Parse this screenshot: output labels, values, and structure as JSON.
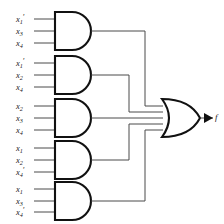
{
  "diagram": {
    "type": "logic-circuit",
    "output_label": "f",
    "and_gates": [
      {
        "id": "and-gate-1",
        "inputs": [
          {
            "var": "x",
            "sub": "1",
            "primed": true
          },
          {
            "var": "x",
            "sub": "3",
            "primed": false
          },
          {
            "var": "x",
            "sub": "4",
            "primed": false
          }
        ]
      },
      {
        "id": "and-gate-2",
        "inputs": [
          {
            "var": "x",
            "sub": "1",
            "primed": true
          },
          {
            "var": "x",
            "sub": "2",
            "primed": false
          },
          {
            "var": "x",
            "sub": "4",
            "primed": false
          }
        ]
      },
      {
        "id": "and-gate-3",
        "inputs": [
          {
            "var": "x",
            "sub": "2",
            "primed": false
          },
          {
            "var": "x",
            "sub": "3",
            "primed": false
          },
          {
            "var": "x",
            "sub": "4",
            "primed": false
          }
        ]
      },
      {
        "id": "and-gate-4",
        "inputs": [
          {
            "var": "x",
            "sub": "1",
            "primed": false
          },
          {
            "var": "x",
            "sub": "2",
            "primed": false
          },
          {
            "var": "x",
            "sub": "4",
            "primed": true
          }
        ]
      },
      {
        "id": "and-gate-5",
        "inputs": [
          {
            "var": "x",
            "sub": "1",
            "primed": false
          },
          {
            "var": "x",
            "sub": "3",
            "primed": false
          },
          {
            "var": "x",
            "sub": "4",
            "primed": true
          }
        ]
      }
    ],
    "or_gate": {
      "id": "or-gate",
      "input_count": 5
    },
    "colors": {
      "gate_outline": "#111111",
      "wire": "#4a4a4a",
      "background": "#ffffff",
      "text": "#1a1a1a"
    }
  },
  "labels": {
    "g1i1": "x",
    "g1i1s": "1",
    "g1i1p": "′",
    "g1i2": "x",
    "g1i2s": "3",
    "g1i2p": "",
    "g1i3": "x",
    "g1i3s": "4",
    "g1i3p": "",
    "g2i1": "x",
    "g2i1s": "1",
    "g2i1p": "′",
    "g2i2": "x",
    "g2i2s": "2",
    "g2i2p": "",
    "g2i3": "x",
    "g2i3s": "4",
    "g2i3p": "",
    "g3i1": "x",
    "g3i1s": "2",
    "g3i1p": "",
    "g3i2": "x",
    "g3i2s": "3",
    "g3i2p": "",
    "g3i3": "x",
    "g3i3s": "4",
    "g3i3p": "",
    "g4i1": "x",
    "g4i1s": "1",
    "g4i1p": "",
    "g4i2": "x",
    "g4i2s": "2",
    "g4i2p": "",
    "g4i3": "x",
    "g4i3s": "4",
    "g4i3p": "′",
    "g5i1": "x",
    "g5i1s": "1",
    "g5i1p": "",
    "g5i2": "x",
    "g5i2s": "3",
    "g5i2p": "",
    "g5i3": "x",
    "g5i3s": "4",
    "g5i3p": "′",
    "output": "f"
  }
}
